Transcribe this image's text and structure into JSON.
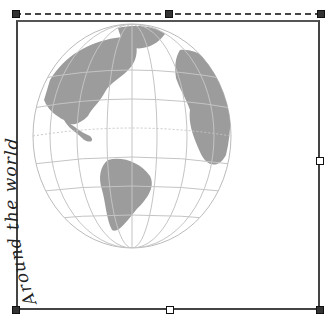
{
  "object": {
    "type": "grouped-graphic",
    "curved_text": "Around the world",
    "image": "globe-americas-atlantic"
  },
  "selection": {
    "handles": [
      "top-left",
      "top-center",
      "top-right",
      "middle-right",
      "bottom-left",
      "bottom-center",
      "bottom-right"
    ],
    "rotation_guide": "dashed-line"
  },
  "colors": {
    "frame": "#444444",
    "land": "#9a9a9a",
    "ocean": "#ffffff",
    "grid": "#b8b8b8",
    "text": "#222222"
  }
}
